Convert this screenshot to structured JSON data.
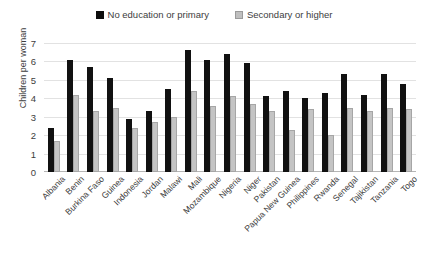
{
  "chart_data": {
    "type": "bar",
    "title": "",
    "xlabel": "",
    "ylabel": "Children per woman",
    "ylim": [
      0,
      7
    ],
    "yticks": [
      0,
      1,
      2,
      3,
      4,
      5,
      6,
      7
    ],
    "grid": true,
    "legend_position": "top-center",
    "categories": [
      "Albania",
      "Benin",
      "Burkina Faso",
      "Guinea",
      "Indonesia",
      "Jordan",
      "Malawi",
      "Mali",
      "Mozambique",
      "Nigeria",
      "Niger",
      "Pakistan",
      "Papua New Guinea",
      "Philippines",
      "Rwanda",
      "Senegal",
      "Tajikistan",
      "Tanzania",
      "Togo"
    ],
    "series": [
      {
        "name": "No education or primary",
        "color": "#111111",
        "values": [
          2.4,
          6.1,
          5.7,
          5.1,
          2.9,
          3.3,
          4.5,
          6.6,
          6.1,
          6.4,
          5.9,
          4.1,
          4.4,
          4.0,
          4.3,
          5.3,
          4.2,
          5.3,
          4.8
        ]
      },
      {
        "name": "Secondary or higher",
        "color": "#c4c4c4",
        "values": [
          1.7,
          4.2,
          3.3,
          3.5,
          2.4,
          2.7,
          3.0,
          4.4,
          3.6,
          4.1,
          3.7,
          3.3,
          2.3,
          3.4,
          2.0,
          3.5,
          3.3,
          3.5,
          3.4
        ]
      }
    ]
  },
  "legend": {
    "entries": [
      {
        "label": "No education or primary",
        "swatch": "dark-square-icon"
      },
      {
        "label": "Secondary or higher",
        "swatch": "light-square-icon"
      }
    ]
  }
}
